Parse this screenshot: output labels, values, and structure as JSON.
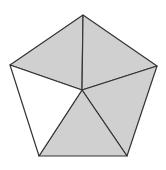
{
  "diagram": {
    "type": "pentagon-subdivided",
    "vertices": {
      "top": [
        83,
        15
      ],
      "right": [
        157,
        66
      ],
      "bottom_right": [
        127,
        156
      ],
      "bottom_left": [
        39,
        156
      ],
      "left": [
        10,
        65
      ],
      "center": [
        82,
        90
      ]
    },
    "triangles": [
      {
        "name": "top-left",
        "points": [
          "top",
          "left",
          "center"
        ],
        "shaded": true
      },
      {
        "name": "top-right",
        "points": [
          "top",
          "right",
          "center"
        ],
        "shaded": true
      },
      {
        "name": "right-lower",
        "points": [
          "right",
          "bottom_right",
          "center"
        ],
        "shaded": true
      },
      {
        "name": "bottom",
        "points": [
          "bottom_right",
          "bottom_left",
          "center"
        ],
        "shaded": true
      },
      {
        "name": "left-lower",
        "points": [
          "bottom_left",
          "left",
          "center"
        ],
        "shaded": false
      }
    ],
    "colors": {
      "shade": "#d0d0d0",
      "unshaded": "#ffffff",
      "stroke": "#333333"
    }
  }
}
